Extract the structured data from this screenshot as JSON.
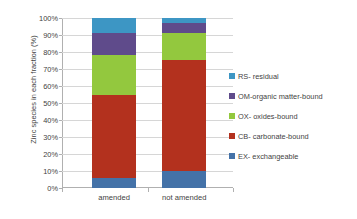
{
  "chart_data": {
    "type": "bar",
    "stacked": true,
    "stack_mode": "percent",
    "title": "",
    "xlabel": "",
    "ylabel": "Zinc species in each fraction (%)",
    "categories": [
      "amended",
      "not amended"
    ],
    "ylim": [
      0,
      100
    ],
    "yticks": [
      0,
      10,
      20,
      30,
      40,
      50,
      60,
      70,
      80,
      90,
      100
    ],
    "ytick_labels": [
      "0%",
      "10%",
      "20%",
      "30%",
      "40%",
      "50%",
      "60%",
      "70%",
      "80%",
      "90%",
      "100%"
    ],
    "grid": true,
    "legend_position": "right",
    "series": [
      {
        "name": "EX- exchangeable",
        "color": "#4472A8",
        "values": [
          6,
          10
        ]
      },
      {
        "name": "CB- carbonate-bound",
        "color": "#B3311E",
        "values": [
          49,
          65.5
        ]
      },
      {
        "name": "OX- oxides-bound",
        "color": "#93C councils"
      },
      {
        "name": "OM-organic matter-bound",
        "color": "#5F4B8B",
        "values": [
          13,
          6
        ]
      },
      {
        "name": "RS- residual",
        "color": "#3D96C4",
        "values": [
          9,
          3
        ]
      }
    ],
    "series_order_bottom_to_top": [
      "EX- exchangeable",
      "CB- carbonate-bound",
      "OX- oxides-bound",
      "OM-organic matter-bound",
      "RS- residual"
    ],
    "cumulative_boundaries": {
      "amended": [
        0,
        6,
        55,
        78,
        91,
        100
      ],
      "not amended": [
        0,
        10,
        75.5,
        91,
        97,
        100
      ]
    }
  },
  "legend": {
    "items": [
      {
        "label": "RS- residual",
        "color": "#3D96C4"
      },
      {
        "label": "OM-organic matter-bound",
        "color": "#5F4B8B"
      },
      {
        "label": "OX- oxides-bound",
        "color": "#93C83E"
      },
      {
        "label": "CB- carbonate-bound",
        "color": "#B3311E"
      },
      {
        "label": "EX- exchangeable",
        "color": "#4472A8"
      }
    ]
  },
  "axis": {
    "y_title": "Zinc species in each fraction (%)"
  }
}
